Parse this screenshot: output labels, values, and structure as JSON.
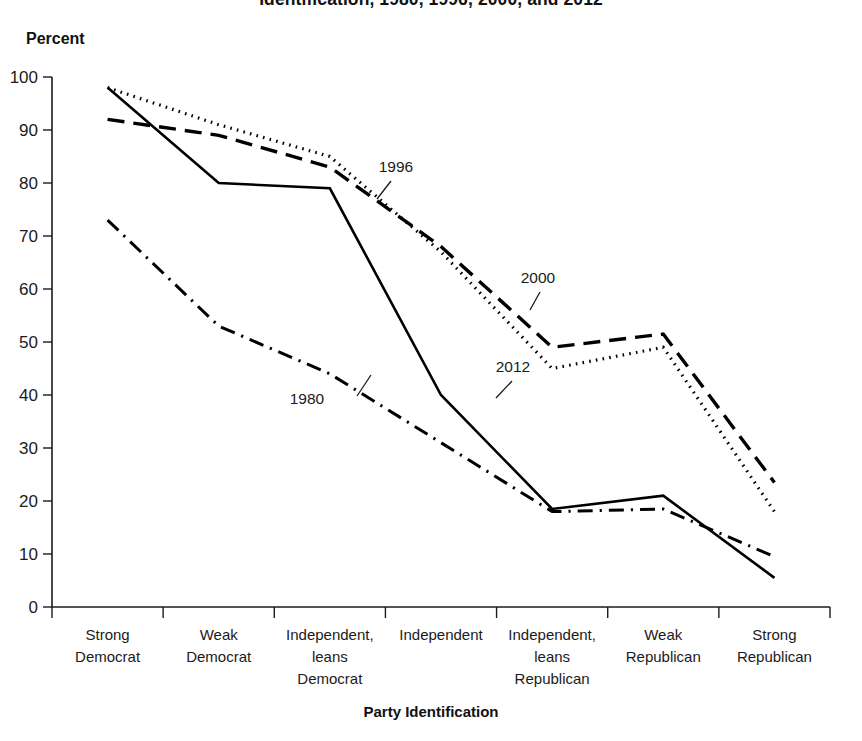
{
  "chart_data": {
    "type": "line",
    "title": "Identification, 1980, 1996, 2000, and 2012",
    "xlabel": "Party Identification",
    "ylabel": "Percent",
    "ylim": [
      0,
      100
    ],
    "yticks": [
      "0",
      "10",
      "20",
      "30",
      "40",
      "50",
      "60",
      "70",
      "80",
      "90",
      "100"
    ],
    "grid": false,
    "legend_position": "inline-annotations",
    "categories": [
      "Strong Democrat",
      "Weak Democrat",
      "Independent, leans Democrat",
      "Independent",
      "Independent, leans Republican",
      "Weak Republican",
      "Strong Republican"
    ],
    "category_lines": [
      [
        "Strong",
        "Democrat"
      ],
      [
        "Weak",
        "Democrat"
      ],
      [
        "Independent,",
        "leans",
        "Democrat"
      ],
      [
        "Independent"
      ],
      [
        "Independent,",
        "leans",
        "Republican"
      ],
      [
        "Weak",
        "Republican"
      ],
      [
        "Strong",
        "Republican"
      ]
    ],
    "series": [
      {
        "name": "1996",
        "style": "dotted",
        "values": [
          98,
          91,
          85,
          67,
          45,
          49,
          18
        ]
      },
      {
        "name": "2000",
        "style": "dashed",
        "values": [
          92,
          89,
          83,
          68,
          49,
          51.5,
          23.5
        ]
      },
      {
        "name": "2012",
        "style": "solid",
        "values": [
          98,
          80,
          79,
          40,
          18.5,
          21,
          5.5
        ]
      },
      {
        "name": "1980",
        "style": "dash-dot",
        "values": [
          73,
          53,
          44,
          31,
          18,
          18.5,
          9.5
        ]
      }
    ],
    "annotations": [
      {
        "text": "1996",
        "x": 396,
        "y": 172
      },
      {
        "text": "2000",
        "x": 538,
        "y": 283
      },
      {
        "text": "2012",
        "x": 513,
        "y": 372
      },
      {
        "text": "1980",
        "x": 307,
        "y": 404
      }
    ]
  },
  "colors": {
    "ink": "#1b1b1b",
    "line": "#000000",
    "background": "#ffffff"
  }
}
